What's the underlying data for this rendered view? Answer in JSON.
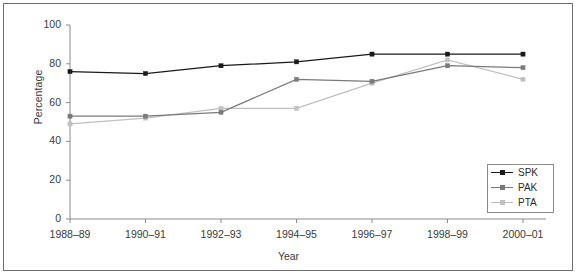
{
  "chart_data": {
    "type": "line",
    "title": "",
    "xlabel": "Year",
    "ylabel": "Percentage",
    "categories": [
      "1988–89",
      "1990–91",
      "1992–93",
      "1994–95",
      "1996–97",
      "1998–99",
      "2000–01"
    ],
    "yticks": [
      0,
      20,
      40,
      60,
      80,
      100
    ],
    "ylim": [
      0,
      100
    ],
    "grid": false,
    "legend_position": "bottom-right",
    "series": [
      {
        "name": "SPK",
        "color": "#1a1a1a",
        "values": [
          76,
          75,
          79,
          81,
          85,
          85,
          85
        ]
      },
      {
        "name": "PAK",
        "color": "#7a7a7a",
        "values": [
          53,
          53,
          55,
          72,
          71,
          79,
          78
        ]
      },
      {
        "name": "PTA",
        "color": "#c0c0c0",
        "values": [
          49,
          52,
          57,
          57,
          70,
          82,
          72
        ]
      }
    ]
  },
  "legend": {
    "items": [
      {
        "label": "SPK"
      },
      {
        "label": "PAK"
      },
      {
        "label": "PTA"
      }
    ]
  },
  "colors": {
    "frame": "#6e6e6e",
    "axis": "#8a8a8a",
    "text": "#3a3a3a",
    "series_spk": "#1a1a1a",
    "series_pak": "#7a7a7a",
    "series_pta": "#c0c0c0"
  }
}
